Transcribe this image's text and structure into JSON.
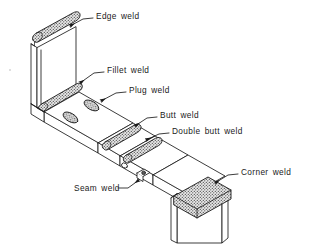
{
  "figure": {
    "background_color": "#ffffff",
    "line_color": "#1a1a1a",
    "weld_fill_color": "#bdbdbd",
    "plate_face_color": "#ffffff",
    "labels": [
      {
        "id": "edge-weld",
        "text": "Edge weld",
        "x": 96,
        "y": 16
      },
      {
        "id": "fillet-weld",
        "text": "Fillet weld",
        "x": 107,
        "y": 70
      },
      {
        "id": "plug-weld",
        "text": "Plug weld",
        "x": 129,
        "y": 90
      },
      {
        "id": "butt-weld",
        "text": "Butt weld",
        "x": 160,
        "y": 115
      },
      {
        "id": "double-butt-weld",
        "text": "Double butt weld",
        "x": 172,
        "y": 131
      },
      {
        "id": "corner-weld",
        "text": "Corner weld",
        "x": 241,
        "y": 172
      },
      {
        "id": "seam-weld",
        "text": "Seam weld",
        "x": 74,
        "y": 190
      }
    ],
    "weld_features": [
      {
        "id": "edge-weld-bead",
        "kind": "bead",
        "label": "Edge weld"
      },
      {
        "id": "fillet-weld-bead",
        "kind": "bead",
        "label": "Fillet weld"
      },
      {
        "id": "plug-weld-hole-1",
        "kind": "ellipse",
        "label": "Plug weld"
      },
      {
        "id": "plug-weld-hole-2",
        "kind": "ellipse",
        "label": "Plug weld"
      },
      {
        "id": "butt-weld-bead",
        "kind": "bead",
        "label": "Butt weld"
      },
      {
        "id": "double-butt-weld-bead",
        "kind": "bead",
        "label": "Double butt weld"
      },
      {
        "id": "seam-weld-tab",
        "kind": "tab",
        "label": "Seam weld"
      },
      {
        "id": "corner-weld-bead",
        "kind": "bead",
        "label": "Corner weld"
      }
    ]
  }
}
